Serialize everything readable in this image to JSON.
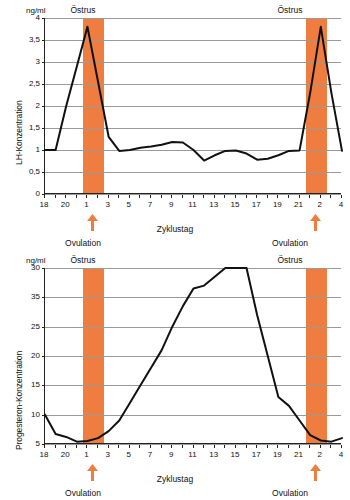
{
  "figure": {
    "orange": "#ee7d3f",
    "axis_color": "#222222",
    "grid_color": "#9a9a9a",
    "curve_color": "#111111"
  },
  "panels": [
    {
      "id": "lh",
      "unit": "ng/ml",
      "y_axis_title": "LH-Konzentration",
      "x_axis_title": "Zyklustag",
      "estrus_label_left": "Östrus",
      "estrus_label_right": "Östrus",
      "ovulation_label_left": "Ovulation",
      "ovulation_label_right": "Ovulation",
      "y_tick_labels": [
        "4",
        "3,5",
        "3",
        "2,5",
        "2",
        "1,5",
        "1",
        "0,5",
        "0"
      ],
      "x_tick_labels": [
        "18",
        "20",
        "1",
        "3",
        "5",
        "7",
        "9",
        "11",
        "13",
        "15",
        "17",
        "19",
        "21",
        "2",
        "4"
      ]
    },
    {
      "id": "progesterone",
      "unit": "ng/ml",
      "y_axis_title": "Progesteron-Konzentration",
      "x_axis_title": "Zyklustag",
      "estrus_label_left": "Östrus",
      "estrus_label_right": "Östrus",
      "ovulation_label_left": "Ovulation",
      "ovulation_label_right": "Ovulation",
      "y_tick_labels": [
        "30",
        "35",
        "25",
        "20",
        "15",
        "10",
        "5",
        "0"
      ],
      "x_tick_labels": [
        "18",
        "20",
        "1",
        "3",
        "5",
        "7",
        "9",
        "11",
        "13",
        "15",
        "17",
        "19",
        "21",
        "2",
        "4"
      ]
    }
  ],
  "chart_data": [
    {
      "type": "line",
      "title": "LH-Konzentration über den Zyklustag",
      "xlabel": "Zyklustag",
      "ylabel": "LH-Konzentration",
      "unit": "ng/ml",
      "ylim": [
        0,
        4
      ],
      "ytick_values": [
        0,
        0.5,
        1,
        1.5,
        2,
        2.5,
        3,
        3.5,
        4
      ],
      "ytick_labels": [
        "0",
        "0,5",
        "1",
        "1,5",
        "2",
        "2,5",
        "3",
        "3,5",
        "4"
      ],
      "grid": true,
      "legend": "none",
      "x_index_range": [
        0,
        28
      ],
      "x_tick_labels": [
        "18",
        "19",
        "20",
        "21",
        "1",
        "2",
        "3",
        "4",
        "5",
        "6",
        "7",
        "8",
        "9",
        "10",
        "11",
        "12",
        "13",
        "14",
        "15",
        "16",
        "17",
        "18",
        "19",
        "20",
        "21",
        "1",
        "2",
        "3",
        "4"
      ],
      "x_labeled_ticks": [
        "18",
        "20",
        "1",
        "3",
        "5",
        "7",
        "9",
        "11",
        "13",
        "15",
        "17",
        "19",
        "21",
        "2",
        "4"
      ],
      "x": [
        0,
        1,
        2,
        3,
        4,
        5,
        6,
        7,
        8,
        9,
        10,
        11,
        12,
        13,
        14,
        15,
        16,
        17,
        18,
        19,
        20,
        21,
        22,
        23,
        24,
        25,
        26,
        27,
        28
      ],
      "values": [
        1.0,
        1.0,
        2.0,
        2.9,
        3.8,
        2.55,
        1.3,
        0.98,
        1.0,
        1.05,
        1.08,
        1.12,
        1.18,
        1.17,
        1.0,
        0.76,
        0.88,
        0.98,
        0.99,
        0.92,
        0.78,
        0.8,
        0.88,
        0.98,
        0.99,
        2.3,
        3.8,
        2.3,
        0.98
      ],
      "shaded_regions": [
        {
          "label": "Östrus",
          "x_start": 3.6,
          "x_end": 5.6,
          "color": "#ee7d3f"
        },
        {
          "label": "Östrus",
          "x_start": 24.6,
          "x_end": 26.6,
          "color": "#ee7d3f"
        }
      ],
      "annotations": [
        {
          "label": "Ovulation",
          "x": 4.6,
          "marker": "up-arrow",
          "color": "#ee7d3f"
        },
        {
          "label": "Ovulation",
          "x": 25.6,
          "marker": "up-arrow",
          "color": "#ee7d3f"
        }
      ]
    },
    {
      "type": "line",
      "title": "Progesteron-Konzentration über den Zyklustag",
      "xlabel": "Zyklustag",
      "ylabel": "Progesteron-Konzentration",
      "unit": "ng/ml",
      "ylim": [
        0,
        30
      ],
      "ytick_values": [
        0,
        5,
        10,
        15,
        20,
        25,
        30,
        35
      ],
      "ytick_labels": [
        "0",
        "5",
        "10",
        "15",
        "20",
        "25",
        "35",
        "30"
      ],
      "grid": true,
      "legend": "none",
      "x_index_range": [
        0,
        28
      ],
      "x_tick_labels": [
        "18",
        "19",
        "20",
        "21",
        "1",
        "2",
        "3",
        "4",
        "5",
        "6",
        "7",
        "8",
        "9",
        "10",
        "11",
        "12",
        "13",
        "14",
        "15",
        "16",
        "17",
        "18",
        "19",
        "20",
        "21",
        "1",
        "2",
        "3",
        "4"
      ],
      "x_labeled_ticks": [
        "18",
        "20",
        "1",
        "3",
        "5",
        "7",
        "9",
        "11",
        "13",
        "15",
        "17",
        "19",
        "21",
        "2",
        "4"
      ],
      "x": [
        0,
        1,
        2,
        3,
        4,
        5,
        6,
        7,
        8,
        9,
        10,
        11,
        12,
        13,
        14,
        15,
        16,
        17,
        18,
        19,
        20,
        21,
        22,
        23,
        24,
        25,
        26,
        27,
        28
      ],
      "values": [
        5.0,
        1.7,
        1.2,
        0.4,
        0.5,
        1.0,
        2.2,
        4.0,
        7.0,
        10.0,
        13.0,
        16.0,
        20.0,
        23.5,
        26.5,
        27.0,
        28.5,
        30.0,
        31.0,
        30.5,
        22.0,
        15.0,
        8.0,
        6.5,
        4.0,
        1.5,
        0.6,
        0.4,
        1.0
      ],
      "shaded_regions": [
        {
          "label": "Östrus",
          "x_start": 3.6,
          "x_end": 5.6,
          "color": "#ee7d3f"
        },
        {
          "label": "Östrus",
          "x_start": 24.6,
          "x_end": 26.6,
          "color": "#ee7d3f"
        }
      ],
      "annotations": [
        {
          "label": "Ovulation",
          "x": 4.6,
          "marker": "up-arrow",
          "color": "#ee7d3f"
        },
        {
          "label": "Ovulation",
          "x": 25.6,
          "marker": "up-arrow",
          "color": "#ee7d3f"
        }
      ]
    }
  ]
}
